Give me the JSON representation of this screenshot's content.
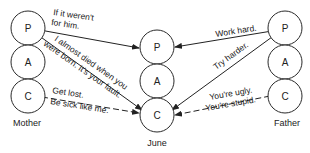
{
  "people": {
    "mother": {
      "label": "Mother",
      "states": [
        "P",
        "A",
        "C"
      ]
    },
    "june": {
      "label": "June",
      "states": [
        "P",
        "A",
        "C"
      ]
    },
    "father": {
      "label": "Father",
      "states": [
        "P",
        "A",
        "C"
      ]
    }
  },
  "messages": [
    {
      "from": "mother.P",
      "to": "june.P",
      "style": "solid",
      "lines": [
        "If it weren't",
        "for him."
      ]
    },
    {
      "from": "mother.P",
      "to": "june.C",
      "style": "solid",
      "lines": [
        "I almost died when you",
        "were born. It's your fault."
      ]
    },
    {
      "from": "mother.C",
      "to": "june.C",
      "style": "dashed",
      "lines": [
        "Get lost.",
        "Be sick like me."
      ]
    },
    {
      "from": "father.P",
      "to": "june.P",
      "style": "solid",
      "lines": [
        "Work hard."
      ]
    },
    {
      "from": "father.P",
      "to": "june.C",
      "style": "solid",
      "lines": [
        "Try harder."
      ]
    },
    {
      "from": "father.C",
      "to": "june.C",
      "style": "dashed",
      "lines": [
        "You're ugly.",
        "You're stupid."
      ]
    }
  ]
}
